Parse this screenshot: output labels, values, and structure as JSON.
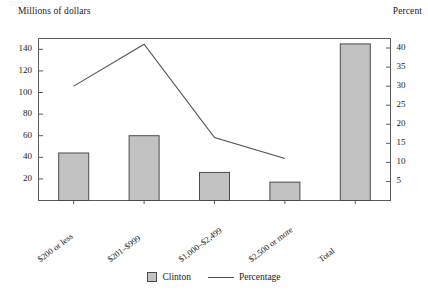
{
  "axis_titles": {
    "left": "Millions of dollars",
    "right": "Percent"
  },
  "legend": {
    "bar_label": "Clinton",
    "line_label": "Percentage"
  },
  "chart_data": {
    "type": "bar",
    "title": "",
    "subtitle": "",
    "xlabel": "",
    "ylabel": "Millions of dollars",
    "y2label": "Percent",
    "grid": false,
    "legend_position": "bottom-center",
    "categories": [
      "$200 or less",
      "$201–$999",
      "$1,000–$2,499",
      "$2,500 or more",
      "Total"
    ],
    "ylim": [
      0,
      150
    ],
    "yticks": [
      20,
      40,
      60,
      80,
      100,
      120,
      140
    ],
    "y2lim": [
      0,
      42.5
    ],
    "y2ticks": [
      5,
      10,
      15,
      20,
      25,
      30,
      35,
      40
    ],
    "series": [
      {
        "name": "Clinton",
        "kind": "bar",
        "axis": "left",
        "color": "#c2c2c2",
        "values": [
          44,
          60,
          26,
          17,
          145
        ]
      },
      {
        "name": "Percentage",
        "kind": "line",
        "axis": "right",
        "color": "#4f4f4f",
        "x": [
          "$200 or less",
          "$201–$999",
          "$1,000–$2,499",
          "$2,500 or more"
        ],
        "values": [
          30,
          41,
          16.5,
          11
        ]
      }
    ]
  }
}
